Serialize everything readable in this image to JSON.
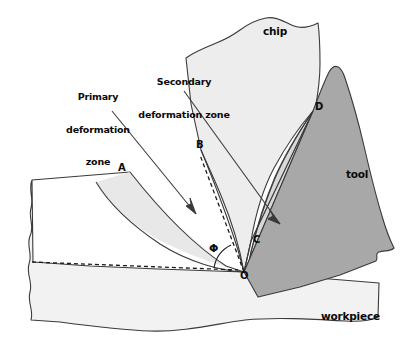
{
  "figure": {
    "background_color": "#ffffff",
    "line_color": "#3a3a3a",
    "text_color": "#0a0a0a"
  },
  "colors": {
    "chip_fill": "#ededed",
    "workpiece_fill": "#f2f2f2",
    "primary_zone_fill": "#e8e8e8",
    "secondary_zone_fill": "#d8d8d8",
    "tool_fill": "#a8a8a8",
    "outline": "#3a3a3a",
    "dashed": "#1a1a1a"
  },
  "callouts": [
    {
      "id": "primary",
      "lines": [
        "Primary",
        "deformation",
        "zone"
      ],
      "text": "Primary deformation zone"
    },
    {
      "id": "secondary",
      "lines": [
        "Secondary",
        "deformation zone"
      ],
      "text": "Secondary deformation zone"
    }
  ],
  "regions": [
    {
      "id": "chip",
      "label": "chip"
    },
    {
      "id": "tool",
      "label": "tool"
    },
    {
      "id": "workpiece",
      "label": "workpiece"
    }
  ],
  "points": [
    {
      "id": "A",
      "label": "A",
      "x": 124,
      "y": 170
    },
    {
      "id": "B",
      "label": "B",
      "x": 201,
      "y": 150
    },
    {
      "id": "C",
      "label": "C",
      "x": 251,
      "y": 241
    },
    {
      "id": "D",
      "label": "D",
      "x": 313,
      "y": 111
    },
    {
      "id": "O",
      "label": "O",
      "x": 244,
      "y": 272
    }
  ],
  "angles": [
    {
      "id": "phi",
      "symbol": "Φ",
      "name": "shear angle"
    }
  ]
}
